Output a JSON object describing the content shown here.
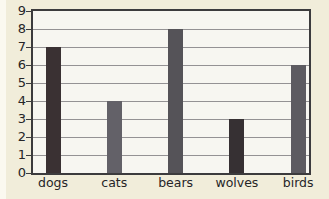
{
  "chart_data": {
    "type": "bar",
    "categories": [
      "dogs",
      "cats",
      "bears",
      "wolves",
      "birds"
    ],
    "values": [
      7,
      4,
      8,
      3,
      6
    ],
    "bar_colors": [
      "#3a3133",
      "#636168",
      "#555358",
      "#363033",
      "#5d5b61"
    ],
    "title": "",
    "xlabel": "",
    "ylabel": "",
    "ylim": [
      0,
      9
    ],
    "y_ticks": [
      0,
      1,
      2,
      3,
      4,
      5,
      6,
      7,
      8,
      9
    ],
    "grid": "horizontal-only",
    "legend": "none"
  },
  "colors": {
    "page_background": "#f1edda",
    "plot_background": "#f7f6f1",
    "plot_border": "#3c3b3d",
    "gridline": "#949294",
    "text": "#262527"
  }
}
